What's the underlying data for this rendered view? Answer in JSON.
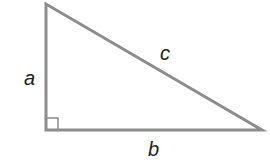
{
  "diagram": {
    "type": "right-triangle",
    "stroke_color": "#8c8c8c",
    "label_color": "#222222",
    "vertices": {
      "top": [
        46,
        4
      ],
      "right_angle": [
        46,
        130
      ],
      "right": [
        262,
        130
      ]
    },
    "labels": {
      "leg_vertical": "a",
      "leg_horizontal": "b",
      "hypotenuse": "c"
    },
    "right_angle_marker": true
  }
}
